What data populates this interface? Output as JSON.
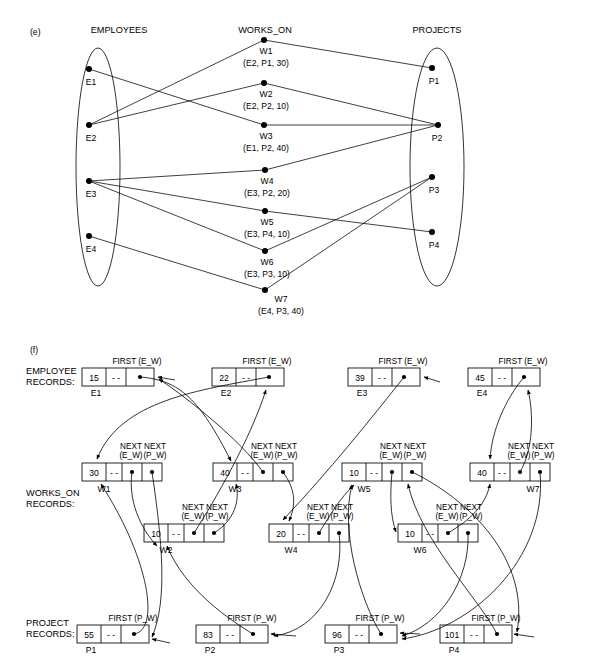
{
  "figure": {
    "part_e_label": "(e)",
    "part_f_label": "(f)"
  },
  "part_e": {
    "headers": {
      "employees": "EMPLOYEES",
      "works_on": "WORKS_ON",
      "projects": "PROJECTS"
    },
    "employees": [
      {
        "id": "E1",
        "x": 89,
        "y": 69
      },
      {
        "id": "E2",
        "x": 89,
        "y": 125
      },
      {
        "id": "E3",
        "x": 89,
        "y": 181
      },
      {
        "id": "E4",
        "x": 89,
        "y": 236
      }
    ],
    "projects": [
      {
        "id": "P1",
        "x": 432,
        "y": 68
      },
      {
        "id": "P2",
        "x": 438,
        "y": 125
      },
      {
        "id": "P3",
        "x": 432,
        "y": 177
      },
      {
        "id": "P4",
        "x": 432,
        "y": 232
      }
    ],
    "works_on": [
      {
        "id": "W1",
        "tuple": "(E2, P1, 30)",
        "emp": "E2",
        "proj": "P1",
        "hours": 30,
        "x": 264,
        "y": 40
      },
      {
        "id": "W2",
        "tuple": "(E2, P2, 10)",
        "emp": "E2",
        "proj": "P2",
        "hours": 10,
        "x": 264,
        "y": 83
      },
      {
        "id": "W3",
        "tuple": "(E1, P2, 40)",
        "emp": "E1",
        "proj": "P2",
        "hours": 40,
        "x": 264,
        "y": 125
      },
      {
        "id": "W4",
        "tuple": "(E3, P2, 20)",
        "emp": "E3",
        "proj": "P2",
        "hours": 20,
        "x": 265,
        "y": 170
      },
      {
        "id": "W5",
        "tuple": "(E3, P4, 10)",
        "emp": "E3",
        "proj": "P4",
        "hours": 10,
        "x": 265,
        "y": 211
      },
      {
        "id": "W6",
        "tuple": "(E3, P3, 10)",
        "emp": "E3",
        "proj": "P3",
        "hours": 10,
        "x": 265,
        "y": 251
      },
      {
        "id": "W7",
        "tuple": "(E4, P3, 40)",
        "emp": "E4",
        "proj": "P3",
        "hours": 40,
        "x": 265,
        "y": 290
      }
    ]
  },
  "part_f": {
    "row_labels": {
      "employee": "EMPLOYEE\nRECORDS:",
      "employee_line1": "EMPLOYEE",
      "employee_line2": "RECORDS:",
      "works_on_line1": "WORKS_ON",
      "works_on_line2": "RECORDS:",
      "project_line1": "PROJECT",
      "project_line2": "RECORDS:"
    },
    "pointer_captions": {
      "first_ew": "FIRST (E_W)",
      "first_pw": "FIRST (P_W)",
      "next_ew_line1": "NEXT",
      "next_ew_line2": "(E_W)",
      "next_pw_line1": "NEXT",
      "next_pw_line2": "(P_W)"
    },
    "null_marker": "- -",
    "employee_records": [
      {
        "name": "E1",
        "value": "15",
        "null": "- -",
        "x": 82,
        "y": 368
      },
      {
        "name": "E2",
        "value": "22",
        "null": "- -",
        "x": 212,
        "y": 368
      },
      {
        "name": "E3",
        "value": "39",
        "null": "- -",
        "x": 348,
        "y": 368
      },
      {
        "name": "E4",
        "value": "45",
        "null": "- -",
        "x": 468,
        "y": 368
      }
    ],
    "works_on_records": [
      {
        "name": "W1",
        "value": "30",
        "null": "- -",
        "x": 82,
        "y": 463
      },
      {
        "name": "W2",
        "value": "10",
        "null": "- -",
        "x": 144,
        "y": 524
      },
      {
        "name": "W3",
        "value": "40",
        "null": "- -",
        "x": 213,
        "y": 463
      },
      {
        "name": "W4",
        "value": "20",
        "null": "- -",
        "x": 269,
        "y": 524
      },
      {
        "name": "W5",
        "value": "10",
        "null": "- -",
        "x": 342,
        "y": 463
      },
      {
        "name": "W6",
        "value": "10",
        "null": "- -",
        "x": 398,
        "y": 524
      },
      {
        "name": "W7",
        "value": "40",
        "null": "- -",
        "x": 470,
        "y": 463
      }
    ],
    "project_records": [
      {
        "name": "P1",
        "value": "55",
        "null": "- -",
        "x": 77,
        "y": 625
      },
      {
        "name": "P2",
        "value": "83",
        "null": "- -",
        "x": 196,
        "y": 625
      },
      {
        "name": "P3",
        "value": "96",
        "null": "- -",
        "x": 325,
        "y": 625
      },
      {
        "name": "P4",
        "value": "101",
        "null": "- -",
        "x": 440,
        "y": 625
      }
    ]
  }
}
